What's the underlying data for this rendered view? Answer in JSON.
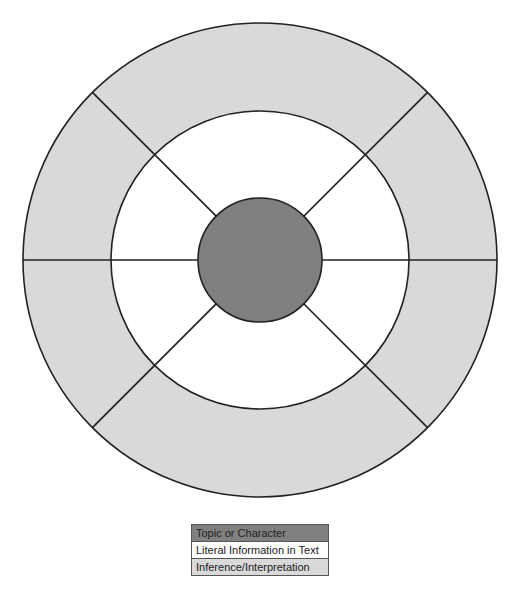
{
  "diagram": {
    "type": "concentric-wheel",
    "center": {
      "x": 260,
      "y": 260
    },
    "rings": {
      "hub": {
        "radius": 62,
        "color": "#7f7f7f",
        "label": "Topic or Character"
      },
      "inner": {
        "radius": 149,
        "color": "#ffffff",
        "label": "Literal Information in Text"
      },
      "outer": {
        "radius": 237,
        "color": "#d9d9d9",
        "label": "Inference/Interpretation"
      }
    },
    "spoke_angles_deg": [
      0,
      45,
      135,
      180,
      225,
      315
    ],
    "stroke_color": "#222222"
  },
  "legend": {
    "items": [
      {
        "label": "Topic or Character",
        "color": "#808080"
      },
      {
        "label": "Literal Information in Text",
        "color": "#ffffff"
      },
      {
        "label": "Inference/Interpretation",
        "color": "#d9d9d9"
      }
    ]
  }
}
